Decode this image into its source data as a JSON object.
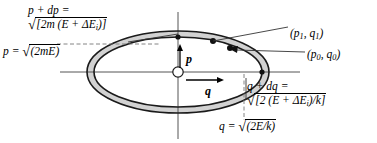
{
  "figure": {
    "name": "phase-space-ellipse-diagram",
    "background_color": "#ffffff",
    "stroke_color": "#000000",
    "annulus_fill": "#d0d0d0",
    "width": 377,
    "height": 143
  },
  "axes": {
    "vertical_label": "p",
    "horizontal_label": "q",
    "origin_marker": "open-circle"
  },
  "labels": {
    "p_plus_dp": {
      "line1": "p + dp =",
      "radical_sign": "√",
      "line2_body_pre": "[2m (E + ΔE",
      "line2_sub": "i",
      "line2_body_post": ")]"
    },
    "p": {
      "lhs": "p =",
      "radical_sign": "√",
      "body": "(2mE)"
    },
    "q_plus_dq": {
      "line1_pre": "q + d",
      "line1_post": "q =",
      "radical_sign": "√",
      "line2_body_pre": "[2 (E + ΔE",
      "line2_sub": "i",
      "line2_body_post": ")/k]"
    },
    "q": {
      "lhs": "q =",
      "radical_sign": "√",
      "body": "(2E/k)"
    }
  },
  "points": [
    {
      "label_pre": "(p",
      "sub1": "1",
      "mid": ", q",
      "sub2": "1",
      "post": ")"
    },
    {
      "label_pre": "(p",
      "sub1": "0",
      "mid": ", q",
      "sub2": "0",
      "post": ")"
    }
  ]
}
